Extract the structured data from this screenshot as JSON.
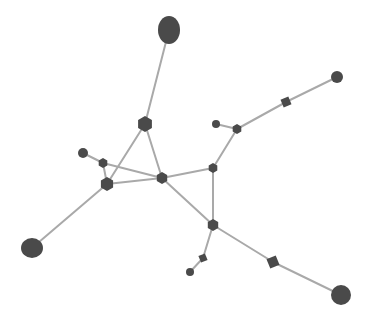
{
  "view": {
    "type": "3d-molecular-network-render",
    "background": "#ffffff",
    "node_color": "#4a4a4a",
    "edge_color": "#a9a9a9"
  },
  "nodes": [
    {
      "id": "top-large",
      "shape": "ellipse",
      "x": 169,
      "y": 30,
      "rx": 11,
      "ry": 14
    },
    {
      "id": "hub-a",
      "shape": "hexagon",
      "x": 145,
      "y": 124,
      "r": 8
    },
    {
      "id": "small-b",
      "shape": "circle",
      "x": 83,
      "y": 153,
      "r": 5
    },
    {
      "id": "node-c",
      "shape": "hexagon",
      "x": 103,
      "y": 163,
      "r": 5
    },
    {
      "id": "hub-d",
      "shape": "hexagon",
      "x": 107,
      "y": 184,
      "r": 7
    },
    {
      "id": "hub-e",
      "shape": "hexagon",
      "x": 162,
      "y": 178,
      "r": 6
    },
    {
      "id": "left-large",
      "shape": "ellipse",
      "x": 32,
      "y": 248,
      "rx": 11,
      "ry": 10
    },
    {
      "id": "node-f",
      "shape": "hexagon",
      "x": 213,
      "y": 168,
      "r": 5
    },
    {
      "id": "small-g",
      "shape": "circle",
      "x": 216,
      "y": 124,
      "r": 4
    },
    {
      "id": "node-h",
      "shape": "hexagon",
      "x": 237,
      "y": 129,
      "r": 5
    },
    {
      "id": "node-i",
      "shape": "diamond",
      "x": 286,
      "y": 102,
      "r": 6
    },
    {
      "id": "small-j",
      "shape": "circle",
      "x": 337,
      "y": 77,
      "r": 6
    },
    {
      "id": "node-k",
      "shape": "hexagon",
      "x": 213,
      "y": 225,
      "r": 6
    },
    {
      "id": "node-l",
      "shape": "diamond",
      "x": 203,
      "y": 258,
      "r": 5
    },
    {
      "id": "small-m",
      "shape": "circle",
      "x": 190,
      "y": 272,
      "r": 4
    },
    {
      "id": "node-n",
      "shape": "diamond",
      "x": 273,
      "y": 262,
      "r": 7
    },
    {
      "id": "right-large",
      "shape": "ellipse",
      "x": 341,
      "y": 295,
      "rx": 10,
      "ry": 10
    }
  ],
  "edges": [
    [
      "top-large",
      "hub-a"
    ],
    [
      "hub-a",
      "hub-d"
    ],
    [
      "hub-a",
      "hub-e"
    ],
    [
      "small-b",
      "node-c"
    ],
    [
      "node-c",
      "hub-d"
    ],
    [
      "node-c",
      "hub-e"
    ],
    [
      "hub-d",
      "hub-e"
    ],
    [
      "hub-d",
      "left-large"
    ],
    [
      "hub-e",
      "node-f"
    ],
    [
      "hub-e",
      "node-k"
    ],
    [
      "node-f",
      "node-h"
    ],
    [
      "node-f",
      "node-k"
    ],
    [
      "small-g",
      "node-h"
    ],
    [
      "node-h",
      "node-i"
    ],
    [
      "node-i",
      "small-j"
    ],
    [
      "node-k",
      "node-l"
    ],
    [
      "node-l",
      "small-m"
    ],
    [
      "node-k",
      "node-n"
    ],
    [
      "node-n",
      "right-large"
    ]
  ]
}
